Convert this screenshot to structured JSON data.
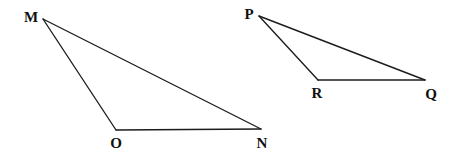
{
  "figure": {
    "kind": "geometry-diagram",
    "background_color": "#ffffff",
    "line_color": "#1c1c1c",
    "label_color": "#101010",
    "line_width": 1.35,
    "canvas": {
      "width": 455,
      "height": 164
    },
    "shapes": [
      {
        "id": "triangle-mon",
        "name": "Triangle MON",
        "vertices": [
          {
            "label": "M",
            "x": 43,
            "y": 19,
            "label_x": 31,
            "label_y": 22
          },
          {
            "label": "O",
            "x": 116,
            "y": 130,
            "label_x": 116,
            "label_y": 148
          },
          {
            "label": "N",
            "x": 261,
            "y": 129,
            "label_x": 262,
            "label_y": 148
          }
        ],
        "edges": [
          {
            "from": "M",
            "to": "N",
            "name": "edge-mn"
          },
          {
            "from": "M",
            "to": "O",
            "name": "edge-mo"
          },
          {
            "from": "O",
            "to": "N",
            "name": "edge-on"
          }
        ]
      },
      {
        "id": "triangle-prq",
        "name": "Triangle PRQ",
        "vertices": [
          {
            "label": "P",
            "x": 259,
            "y": 16,
            "label_x": 249,
            "label_y": 19
          },
          {
            "label": "R",
            "x": 318,
            "y": 80,
            "label_x": 317,
            "label_y": 98
          },
          {
            "label": "Q",
            "x": 425,
            "y": 80,
            "label_x": 431,
            "label_y": 99
          }
        ],
        "edges": [
          {
            "from": "P",
            "to": "Q",
            "name": "edge-pq"
          },
          {
            "from": "P",
            "to": "R",
            "name": "edge-pr"
          },
          {
            "from": "R",
            "to": "Q",
            "name": "edge-rq"
          }
        ]
      }
    ]
  },
  "labels": {
    "m": "M",
    "o": "O",
    "n": "N",
    "p": "P",
    "r": "R",
    "q": "Q"
  }
}
